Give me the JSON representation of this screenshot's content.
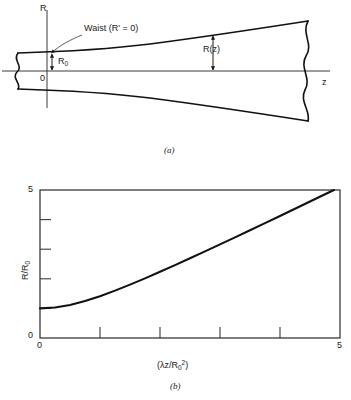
{
  "figure": {
    "panel_a": {
      "caption": "(a)",
      "axis_y_label": "R",
      "axis_x_label": "z",
      "origin_label": "0",
      "waist_label": "Waist (R' = 0)",
      "waist_radius_label": "R",
      "waist_radius_sub": "0",
      "beam_radius_label": "R(z)"
    },
    "panel_b": {
      "caption": "(b)",
      "ylabel_main": "R/R",
      "ylabel_sub": "0",
      "xlabel_prefix": "(",
      "xlabel_lambda": "λ",
      "xlabel_mid": "z/R",
      "xlabel_sub": "0",
      "xlabel_sup": "2",
      "xlabel_suffix": ")",
      "x_tick_min": "0",
      "x_tick_max": "5",
      "y_tick_min": "0",
      "y_tick_max": "5"
    }
  },
  "chart_data": {
    "type": "line",
    "title": "",
    "xlabel": "(λz/R₀²)",
    "ylabel": "R/R₀",
    "xlim": [
      0,
      5
    ],
    "ylim": [
      0,
      5
    ],
    "grid": false,
    "legend": false,
    "x_ticks": [
      0,
      1,
      2,
      3,
      4,
      5
    ],
    "x_tick_labels": [
      "0",
      "",
      "",
      "",
      "",
      "5"
    ],
    "y_ticks": [
      0,
      1,
      2,
      3,
      4,
      5
    ],
    "y_tick_labels": [
      "0",
      "",
      "",
      "",
      "",
      "5"
    ],
    "series": [
      {
        "name": "R/R0 = sqrt(1 + (λz/R0^2)^2)",
        "color": "#111111",
        "x": [
          0.0,
          0.25,
          0.5,
          0.75,
          1.0,
          1.25,
          1.5,
          1.75,
          2.0,
          2.25,
          2.5,
          2.75,
          3.0,
          3.25,
          3.5,
          3.75,
          4.0,
          4.25,
          4.5,
          4.75,
          4.899
        ],
        "values": [
          1.0,
          1.031,
          1.118,
          1.25,
          1.414,
          1.601,
          1.803,
          2.015,
          2.236,
          2.462,
          2.693,
          2.926,
          3.162,
          3.4,
          3.64,
          3.881,
          4.123,
          4.366,
          4.61,
          4.854,
          5.0
        ]
      }
    ]
  }
}
